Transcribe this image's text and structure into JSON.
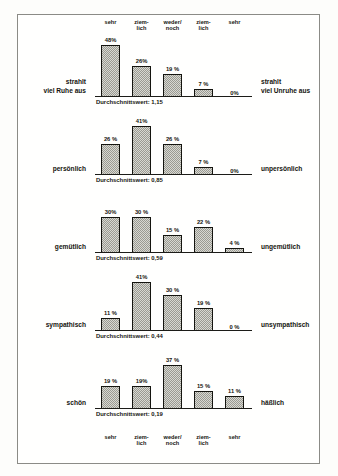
{
  "scale_labels": [
    {
      "line1": "sehr",
      "line2": ""
    },
    {
      "line1": "ziem-",
      "line2": "lich"
    },
    {
      "line1": "weder/",
      "line2": "noch"
    },
    {
      "line1": "ziem-",
      "line2": "lich"
    },
    {
      "line1": "sehr",
      "line2": ""
    }
  ],
  "mean_prefix": "Durchschnittswert:",
  "chart_data": {
    "type": "bar",
    "title": "",
    "subtitle": "",
    "xlabel": "",
    "ylabel": "",
    "ylim": [
      0,
      50
    ],
    "grid": false,
    "legend": "none",
    "categories": [
      "sehr",
      "ziemlich",
      "weder/noch",
      "ziemlich",
      "sehr"
    ],
    "category_lines": [
      [
        "sehr",
        ""
      ],
      [
        "ziem-",
        "lich"
      ],
      [
        "weder/",
        "noch"
      ],
      [
        "ziem-",
        "lich"
      ],
      [
        "sehr",
        ""
      ]
    ],
    "panels": [
      {
        "left_pole": "strahlt viel Ruhe aus",
        "left_pole_lines": [
          "strahlt",
          "viel Ruhe aus"
        ],
        "right_pole": "strahlt viel Unruhe aus",
        "right_pole_lines": [
          "strahlt",
          "viel Unruhe aus"
        ],
        "values": [
          48,
          26,
          19,
          7,
          0
        ],
        "value_labels": [
          "48%",
          "26%",
          "19 %",
          "7 %",
          "0%"
        ],
        "mean_label": "Durchschnittswert: 1,15",
        "mean": 1.15
      },
      {
        "left_pole": "persönlich",
        "left_pole_lines": [
          "persönlich"
        ],
        "right_pole": "unpersönlich",
        "right_pole_lines": [
          "unpersönlich"
        ],
        "values": [
          26,
          41,
          26,
          7,
          0
        ],
        "value_labels": [
          "26 %",
          "41%",
          "26 %",
          "7 %",
          "0%"
        ],
        "mean_label": "Durchschnittswert: 0,85",
        "mean": 0.85
      },
      {
        "left_pole": "gemütlich",
        "left_pole_lines": [
          "gemütlich"
        ],
        "right_pole": "ungemütlich",
        "right_pole_lines": [
          "ungemütlich"
        ],
        "values": [
          30,
          30,
          15,
          22,
          4
        ],
        "value_labels": [
          "30%",
          "30 %",
          "15 %",
          "22 %",
          "4 %"
        ],
        "mean_label": "Durchschnittswert: 0,59",
        "mean": 0.59
      },
      {
        "left_pole": "sympathisch",
        "left_pole_lines": [
          "sympathisch"
        ],
        "right_pole": "unsympathisch",
        "right_pole_lines": [
          "unsympathisch"
        ],
        "values": [
          11,
          41,
          30,
          19,
          0
        ],
        "value_labels": [
          "11 %",
          "41%",
          "30 %",
          "19 %",
          "0 %"
        ],
        "mean_label": "Durchschnittswert: 0,44",
        "mean": 0.44
      },
      {
        "left_pole": "schön",
        "left_pole_lines": [
          "schön"
        ],
        "right_pole": "häßlich",
        "right_pole_lines": [
          "häßlich"
        ],
        "values": [
          19,
          19,
          37,
          15,
          11
        ],
        "value_labels": [
          "19 %",
          "19%",
          "37 %",
          "15 %",
          "11 %"
        ],
        "mean_label": "Durchschnittswert: 0,19",
        "mean": 0.19
      }
    ]
  },
  "colors": {
    "frame": "#8b8b86",
    "ink": "#15150f",
    "bar_fill": "#d8d8d2",
    "bar_hatch": "#9a9a92",
    "paper": "#fdfdfb"
  }
}
